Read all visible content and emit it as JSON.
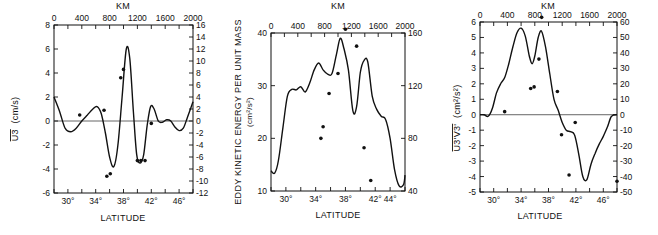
{
  "figure": {
    "top_axis_title": "KM",
    "bottom_axis_title": "LATITUDE"
  },
  "chart_data": [
    {
      "type": "line",
      "id": "panel-left",
      "title": "",
      "xlabel": "LATITUDE",
      "x2label": "KM",
      "ylabel": "U3 (cm/s)",
      "ylabel_overbar": "U3",
      "ylabel_unit": "(cm/s)",
      "y2label": "",
      "xlim": [
        28,
        48
      ],
      "ylim": [
        -6,
        8
      ],
      "y2lim": [
        -12,
        16
      ],
      "x_ticks": [
        30,
        34,
        38,
        42,
        46
      ],
      "x_tick_labels": [
        "30°",
        "34°",
        "38°",
        "42°",
        "46°"
      ],
      "x2_ticks": [
        0,
        400,
        800,
        1200,
        1600,
        2000
      ],
      "x2_tick_labels": [
        "0",
        "400",
        "800",
        "1200",
        "1600",
        "2000"
      ],
      "y_ticks": [
        -6,
        -4,
        -2,
        0,
        2,
        4,
        6,
        8
      ],
      "y_tick_labels": [
        "-6",
        "-4",
        "-2",
        "0",
        "2",
        "4",
        "6",
        "8"
      ],
      "y2_ticks": [
        -12,
        -10,
        -8,
        -6,
        -4,
        -2,
        0,
        2,
        4,
        6,
        8,
        10,
        12,
        14,
        16
      ],
      "y2_tick_labels": [
        "-12",
        "-10",
        "-8",
        "-6",
        "-4",
        "-2",
        "0",
        "2",
        "4",
        "6",
        "8",
        "10",
        "12",
        "14",
        "16"
      ],
      "zero_line": true,
      "grid": false,
      "series": [
        {
          "name": "curve",
          "x": [
            28,
            28.8,
            29.6,
            30.4,
            31.2,
            32,
            32.8,
            33.6,
            34.2,
            34.8,
            35.4,
            36,
            36.6,
            37.2,
            37.8,
            38.4,
            38.9,
            39.4,
            39.9,
            40.4,
            40.9,
            41.4,
            41.9,
            42.4,
            43,
            43.6,
            44.2,
            44.8,
            45.4,
            46,
            46.6,
            47.2,
            48
          ],
          "y": [
            2.0,
            0.8,
            -0.6,
            -0.9,
            -0.6,
            0.0,
            0.5,
            1.0,
            1.2,
            0.6,
            -1.0,
            -3.0,
            -3.8,
            -2.0,
            2.0,
            6.0,
            5.2,
            1.0,
            -2.8,
            -3.5,
            -2.8,
            -0.4,
            1.2,
            1.0,
            0.0,
            -0.1,
            0.1,
            0.0,
            -0.5,
            -0.8,
            -0.6,
            0.3,
            1.6
          ]
        },
        {
          "name": "observations",
          "type": "scatter",
          "x": [
            31.7,
            35.2,
            35.6,
            36.1,
            37.6,
            38.0,
            40.0,
            40.5,
            41.1,
            42.0
          ],
          "y": [
            0.5,
            0.9,
            -4.6,
            -4.4,
            3.6,
            4.3,
            -3.3,
            -3.3,
            -3.3,
            -0.2
          ]
        }
      ]
    },
    {
      "type": "line",
      "id": "panel-middle",
      "title": "",
      "xlabel": "LATITUDE",
      "x2label": "KM",
      "ylabel": "EDDY KINETIC ENERGY PER UNIT MASS",
      "ylabel_unit": "(cm²/s²)",
      "y2label": "",
      "xlim": [
        28,
        46
      ],
      "ylim": [
        10,
        40
      ],
      "y2lim": [
        40,
        160
      ],
      "x_ticks": [
        30,
        34,
        38,
        42,
        44
      ],
      "x_tick_labels": [
        "30°",
        "34°",
        "38°",
        "42°",
        "44°"
      ],
      "x2_ticks": [
        0,
        400,
        800,
        1200,
        1600,
        2000
      ],
      "x2_tick_labels": [
        "0",
        "400",
        "800",
        "1200",
        "1600",
        "2000"
      ],
      "y_ticks": [
        10,
        20,
        30,
        40
      ],
      "y_tick_labels": [
        "10",
        "20",
        "30",
        "40"
      ],
      "y2_ticks": [
        40,
        80,
        120,
        160
      ],
      "y2_tick_labels": [
        "40",
        "80",
        "120",
        "160"
      ],
      "zero_line": false,
      "grid": false,
      "series": [
        {
          "name": "curve",
          "x": [
            28,
            28.5,
            29,
            29.6,
            30.2,
            30.8,
            31.4,
            32,
            32.6,
            33.2,
            33.8,
            34.4,
            35,
            35.6,
            36.2,
            36.8,
            37.3,
            37.8,
            38.4,
            39,
            39.5,
            40,
            40.5,
            41,
            41.6,
            42.2,
            42.8,
            43.4,
            44,
            44.6,
            45.2,
            45.8,
            46
          ],
          "y": [
            13.8,
            13.4,
            15.8,
            22.0,
            28.0,
            29.3,
            29.2,
            29.8,
            28.8,
            30.5,
            33.0,
            34.3,
            33.0,
            32.2,
            32.3,
            36.0,
            39.0,
            37.0,
            33.0,
            25.2,
            26.0,
            32.5,
            34.8,
            34.5,
            28.0,
            25.5,
            24.2,
            23.6,
            20.0,
            14.0,
            11.0,
            11.2,
            13.0
          ]
        },
        {
          "name": "observations",
          "type": "scatter",
          "x": [
            34.7,
            35.0,
            35.8,
            37.0,
            38.0,
            39.5,
            40.5,
            41.4
          ],
          "y": [
            20.0,
            22.2,
            28.5,
            32.3,
            40.7,
            37.5,
            18.2,
            12.0
          ]
        }
      ]
    },
    {
      "type": "line",
      "id": "panel-right",
      "title": "",
      "xlabel": "LATITUDE",
      "x2label": "KM",
      "ylabel": "U3'V3' (cm²/s²)",
      "ylabel_overbar": "U3'V3'",
      "ylabel_unit": "(cm²/s²)",
      "y2label": "",
      "xlim": [
        28,
        48
      ],
      "ylim": [
        -5,
        6
      ],
      "y2lim": [
        -50,
        60
      ],
      "x_ticks": [
        30,
        34,
        38,
        42,
        46
      ],
      "x_tick_labels": [
        "30°",
        "34°",
        "38°",
        "42°",
        "46°"
      ],
      "x2_ticks": [
        0,
        400,
        800,
        1200,
        1600,
        2000
      ],
      "x2_tick_labels": [
        "0",
        "400",
        "800",
        "1200",
        "1600",
        "2000"
      ],
      "y_ticks": [
        -5,
        -4,
        -3,
        -2,
        -1,
        0,
        1,
        2,
        3,
        4,
        5,
        6
      ],
      "y_tick_labels": [
        "-5",
        "-4",
        "-3",
        "-2",
        "-1",
        "0",
        "1",
        "2",
        "3",
        "4",
        "5",
        "6"
      ],
      "y2_ticks": [
        -50,
        -40,
        -30,
        -20,
        -10,
        0,
        10,
        20,
        30,
        40,
        50,
        60
      ],
      "y2_tick_labels": [
        "-50",
        "-40",
        "-30",
        "-20",
        "-10",
        "0",
        "10",
        "20",
        "30",
        "40",
        "50",
        "60"
      ],
      "zero_line": true,
      "grid": false,
      "series": [
        {
          "name": "curve",
          "x": [
            28,
            28.6,
            29.2,
            29.8,
            30.4,
            31.0,
            31.6,
            32.2,
            32.8,
            33.4,
            34.0,
            34.6,
            35.2,
            35.6,
            36.0,
            36.5,
            37.0,
            37.6,
            38.2,
            38.8,
            39.4,
            40.0,
            40.6,
            41.2,
            41.8,
            42.4,
            43.0,
            43.6,
            44.2,
            44.8,
            45.4,
            46.0,
            46.6,
            47.2,
            48
          ],
          "y": [
            0.0,
            0.0,
            -0.1,
            0.4,
            1.4,
            2.0,
            2.4,
            3.3,
            4.4,
            5.3,
            5.6,
            5.1,
            3.8,
            3.3,
            3.8,
            5.0,
            5.4,
            4.3,
            2.6,
            1.0,
            0.3,
            -0.5,
            -1.0,
            -1.1,
            -1.3,
            -2.5,
            -4.0,
            -4.2,
            -3.2,
            -2.5,
            -1.9,
            -1.4,
            -0.8,
            -0.1,
            0.0
          ]
        },
        {
          "name": "observations",
          "type": "scatter",
          "x": [
            31.6,
            35.4,
            35.9,
            36.6,
            37.0,
            39.3,
            39.9,
            41.0,
            41.9,
            48.0
          ],
          "y": [
            0.2,
            1.7,
            1.8,
            3.6,
            6.3,
            1.5,
            -1.3,
            -3.9,
            -0.5,
            -4.3
          ]
        }
      ]
    }
  ]
}
